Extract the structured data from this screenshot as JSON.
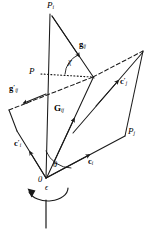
{
  "figure": {
    "type": "vector-diagram",
    "background_color": "#ffffff",
    "stroke_color": "#1a1a1a",
    "width": 150,
    "height": 230,
    "labels": {
      "apex_point": "P",
      "apex_point_sub": "i",
      "relative_velocity": "g",
      "relative_velocity_sub": "ij",
      "relative_velocity_primed": "g",
      "relative_velocity_primed_sub": "ij",
      "relative_velocity_primed_mark": "′",
      "center_of_mass": "G",
      "center_of_mass_sub": "ij",
      "point_p": "P",
      "point_pj": "P",
      "point_pj_sub": "j",
      "vector_ci": "c",
      "vector_ci_sub": "i",
      "vector_ci_primed": "c",
      "vector_ci_primed_sub": "i",
      "vector_ci_primed_mark": "′",
      "vector_cj_primed": "c",
      "vector_cj_primed_sub": "j",
      "vector_cj_primed_mark": "′",
      "angle_chi": "χ",
      "angle_theta": "θ",
      "origin": "0",
      "rotation_epsilon": "ϵ"
    },
    "geometry": {
      "origin": [
        46,
        178
      ],
      "apex_pi": [
        52,
        14
      ],
      "point_p_on_axis": [
        46,
        74
      ],
      "collision_point": [
        93,
        77
      ],
      "dashed_right_vertex": [
        143,
        51
      ],
      "dashed_left_vertex": [
        9,
        110
      ],
      "point_pj": [
        125,
        135
      ],
      "left_quad_corner": [
        17,
        130
      ],
      "axis_bottom": [
        46,
        196
      ],
      "rotation_axis_bottom": [
        46,
        228
      ]
    }
  }
}
